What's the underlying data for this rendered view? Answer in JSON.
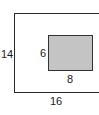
{
  "diagram": {
    "outer_rect": {
      "height_label": "14",
      "width_label": "16"
    },
    "inner_rect": {
      "height_label": "6",
      "width_label": "8",
      "fill": "#c4c4c4"
    }
  }
}
